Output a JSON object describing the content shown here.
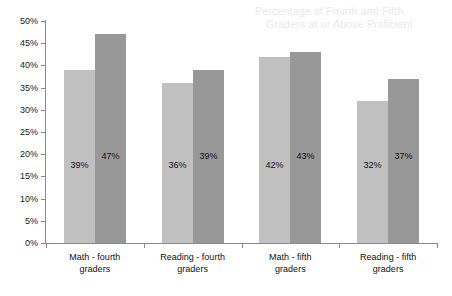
{
  "chart_data": {
    "type": "bar",
    "title": "",
    "subtitle": "",
    "xlabel": "",
    "ylabel": "",
    "ylim": [
      0,
      50
    ],
    "y_tick_step": 5,
    "grid": false,
    "legend": "none",
    "value_label_format": "percent",
    "categories": [
      "Math - fourth graders",
      "Reading - fourth graders",
      "Math - fifth graders",
      "Reading - fifth graders"
    ],
    "category_lines": [
      [
        "Math - fourth",
        "graders"
      ],
      [
        "Reading - fourth",
        "graders"
      ],
      [
        "Math - fifth",
        "graders"
      ],
      [
        "Reading - fifth",
        "graders"
      ]
    ],
    "series": [
      {
        "name": "series-light",
        "color": "#c0c0c0",
        "values": [
          39,
          36,
          42,
          32
        ],
        "value_labels": [
          "39%",
          "36%",
          "42%",
          "32%"
        ]
      },
      {
        "name": "series-dark",
        "color": "#989898",
        "values": [
          47,
          39,
          43,
          37
        ],
        "value_labels": [
          "47%",
          "39%",
          "43%",
          "37%"
        ]
      }
    ],
    "y_tick_labels": [
      "50%",
      "45%",
      "40%",
      "35%",
      "30%",
      "25%",
      "20%",
      "15%",
      "10%",
      "5%",
      "0%"
    ],
    "y_tick_values": [
      50,
      45,
      40,
      35,
      30,
      25,
      20,
      15,
      10,
      5,
      0
    ]
  },
  "ghost_text": {
    "line_1": "Percentage of Fourth and Fifth",
    "line_2": "Graders at or Above Proficient"
  },
  "colors": {
    "axis": "#8a8a8a",
    "text": "#111111",
    "background": "#ffffff",
    "bar_light": "#c0c0c0",
    "bar_dark": "#989898"
  }
}
